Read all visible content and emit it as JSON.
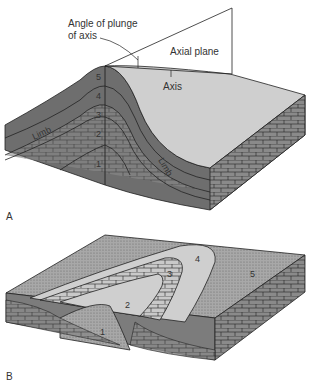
{
  "figure": {
    "panel_a": {
      "label": "A",
      "annotations": {
        "angle_of_plunge_line1": "Angle of plunge",
        "angle_of_plunge_line2": "of axis",
        "axial_plane": "Axial plane",
        "axis": "Axis",
        "limb_left": "Limb",
        "limb_right": "Limb"
      },
      "layers": [
        "1",
        "2",
        "3",
        "4",
        "5"
      ]
    },
    "panel_b": {
      "label": "B",
      "layers": [
        "1",
        "2",
        "3",
        "4",
        "5"
      ]
    }
  },
  "colors": {
    "dark_layer": "#6e6e6e",
    "light_surface": "#cfcfcf",
    "stipple": "#9a9a9a",
    "line": "#222222",
    "text": "#333333"
  }
}
